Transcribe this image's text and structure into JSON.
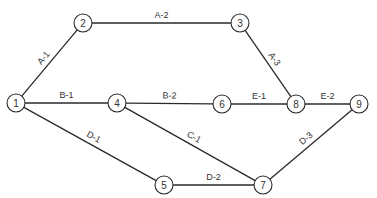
{
  "diagram": {
    "type": "activity-network",
    "nodes": [
      {
        "id": "1",
        "label": "1",
        "x": 16,
        "y": 103
      },
      {
        "id": "2",
        "label": "2",
        "x": 83,
        "y": 23
      },
      {
        "id": "3",
        "label": "3",
        "x": 240,
        "y": 23
      },
      {
        "id": "4",
        "label": "4",
        "x": 117,
        "y": 103
      },
      {
        "id": "5",
        "label": "5",
        "x": 164,
        "y": 185
      },
      {
        "id": "6",
        "label": "6",
        "x": 222,
        "y": 104
      },
      {
        "id": "7",
        "label": "7",
        "x": 263,
        "y": 185
      },
      {
        "id": "8",
        "label": "8",
        "x": 296,
        "y": 104
      },
      {
        "id": "9",
        "label": "9",
        "x": 359,
        "y": 104
      }
    ],
    "edges": [
      {
        "from": "1",
        "to": "2",
        "label": "A-1"
      },
      {
        "from": "2",
        "to": "3",
        "label": "A-2"
      },
      {
        "from": "3",
        "to": "8",
        "label": "A-3"
      },
      {
        "from": "1",
        "to": "4",
        "label": "B-1"
      },
      {
        "from": "4",
        "to": "6",
        "label": "B-2"
      },
      {
        "from": "4",
        "to": "7",
        "label": "C-1"
      },
      {
        "from": "1",
        "to": "5",
        "label": "D-1"
      },
      {
        "from": "5",
        "to": "7",
        "label": "D-2"
      },
      {
        "from": "7",
        "to": "9",
        "label": "D-3"
      },
      {
        "from": "6",
        "to": "8",
        "label": "E-1"
      },
      {
        "from": "8",
        "to": "9",
        "label": "E-2"
      }
    ]
  }
}
